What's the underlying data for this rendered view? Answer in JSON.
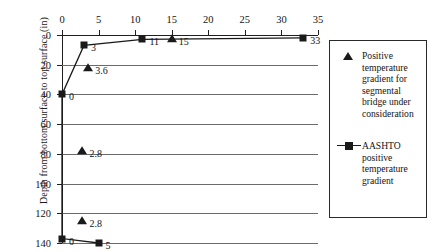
{
  "chart_data": {
    "type": "line",
    "title": "",
    "xlabel": "",
    "ylabel": "Depth from bottom surface to top surface (in)",
    "xlim": [
      0,
      35
    ],
    "ylim": [
      0,
      140
    ],
    "y_axis_inverted": true,
    "x_axis_position": "top",
    "grid": "horizontal",
    "xticks": [
      0,
      5,
      10,
      15,
      20,
      25,
      30,
      35
    ],
    "yticks": [
      0,
      20,
      40,
      60,
      80,
      100,
      120,
      140
    ],
    "legend_position": "right-outside",
    "series": [
      {
        "name": "AASHTO positive temperature gradient",
        "marker": "square",
        "line": true,
        "points": [
          {
            "x": 33,
            "y": 2,
            "label": "33"
          },
          {
            "x": 11,
            "y": 3,
            "label": "11"
          },
          {
            "x": 3,
            "y": 7,
            "label": "3"
          },
          {
            "x": 0,
            "y": 40,
            "label": "0"
          },
          {
            "x": 0,
            "y": 137,
            "label": "0"
          },
          {
            "x": 5,
            "y": 140,
            "label": "5"
          }
        ]
      },
      {
        "name": "Positive temperature gradient for segmental bridge under consideration",
        "marker": "triangle",
        "line": false,
        "points": [
          {
            "x": 15,
            "y": 3,
            "label": "15"
          },
          {
            "x": 3.6,
            "y": 22,
            "label": "3.6"
          },
          {
            "x": 2.8,
            "y": 78,
            "label": "2.8"
          },
          {
            "x": 2.8,
            "y": 125,
            "label": "2.8"
          }
        ]
      }
    ],
    "legend": [
      {
        "marker": "triangle",
        "label": "Positive temperature gradient for segmental bridge under consideration"
      },
      {
        "marker": "line-square",
        "label": "AASHTO positive temperature gradient"
      }
    ]
  }
}
